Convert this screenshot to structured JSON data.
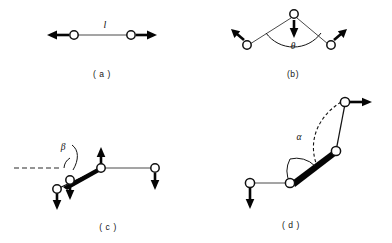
{
  "figure": {
    "background_color": "#ffffff",
    "ink_color": "#111111",
    "width": 392,
    "height": 243
  },
  "panels": [
    {
      "id": "a",
      "caption": "( a )",
      "description": "Linear diatomic stretch: two atoms joined by a bond, displacement arrows pointing outward along the bond axis",
      "symbol": "l",
      "symbol_role": "bond length",
      "atom_count": 2,
      "arrow_count": 2
    },
    {
      "id": "b",
      "caption": "(b)",
      "description": "Bent triatomic bend: apex atom displaced downward, two terminal atoms displaced outward and upward",
      "symbol": "θ",
      "symbol_role": "bond angle",
      "atom_count": 3,
      "arrow_count": 3
    },
    {
      "id": "c",
      "caption": "( c )",
      "description": "Out-of-plane / torsional motion about a reference axis shown as a dashed line, with a wedge bond and atoms displaced vertically",
      "symbol": "β",
      "symbol_role": "out-of-plane angle",
      "atom_count": 4,
      "arrow_count": 4
    },
    {
      "id": "d",
      "caption": "( d )",
      "description": "Torsion about a central bond: dashed arc traces rotation of the terminal group, wedge bond indicates motion toward the viewer",
      "symbol": "α",
      "symbol_role": "torsion angle",
      "atom_count": 4,
      "arrow_count": 2
    }
  ],
  "symbols": {
    "length_l": "l",
    "angle_theta": "θ",
    "angle_beta": "β",
    "angle_alpha": "α"
  },
  "captions": {
    "a": "( a )",
    "b": "(b)",
    "c": "( c )",
    "d": "( d )"
  }
}
